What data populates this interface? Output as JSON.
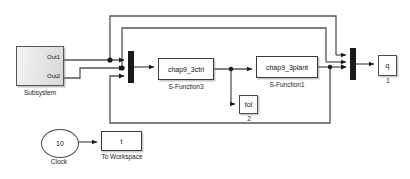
{
  "diagram": {
    "background": "#ffffff",
    "wire_color": "#4d4d4d",
    "block_border": "#3a3a3a"
  },
  "blocks": {
    "subsystem": {
      "name": "Subsystem",
      "caption": "Subsystem",
      "ports": {
        "out1": "Out1",
        "out2": "Out2"
      }
    },
    "sfunction3": {
      "label": "chap9_3ctrl",
      "caption": "S-Function3"
    },
    "sfunction1": {
      "label": "chap9_3plant",
      "caption": "S-Function1"
    },
    "tol": {
      "label": "tol",
      "caption": "2"
    },
    "output_q": {
      "label": "q",
      "caption": "1"
    },
    "clock": {
      "label": "10",
      "caption": "Clock"
    },
    "to_workspace": {
      "label": "t",
      "caption": "To Workspace"
    },
    "mux_left": {
      "name": "Mux",
      "inputs": 3
    },
    "mux_right": {
      "name": "Mux",
      "inputs": 3
    }
  }
}
